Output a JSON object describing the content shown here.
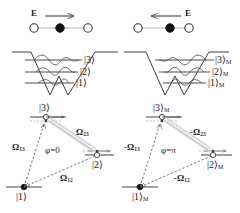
{
  "figure": {
    "colors": {
      "line": "#1a1a1a",
      "wavefunction": "#555555",
      "dashed_level": "#777777",
      "coupling": "#666666",
      "highlight": "#cccccc",
      "atom_filled": "#111111",
      "atom_open": "#ffffff"
    }
  },
  "panels": {
    "top_left": {
      "field_label": "E",
      "field_direction": "right",
      "atoms": [
        {
          "type": "open",
          "name": "atom-open-left"
        },
        {
          "type": "filled",
          "name": "atom-filled-center"
        },
        {
          "type": "open",
          "name": "atom-open-right"
        }
      ]
    },
    "top_right": {
      "field_label": "E",
      "field_direction": "left",
      "atoms": [
        {
          "type": "open",
          "name": "atom-open-left"
        },
        {
          "type": "filled",
          "name": "atom-filled-center"
        },
        {
          "type": "open",
          "name": "atom-open-right"
        }
      ]
    },
    "well_left": {
      "levels": [
        {
          "label": "|3⟩",
          "sub": ""
        },
        {
          "label": "|2⟩",
          "sub": ""
        },
        {
          "label": "|1⟩",
          "sub": ""
        }
      ]
    },
    "well_right": {
      "levels": [
        {
          "label": "|3⟩",
          "sub": "M"
        },
        {
          "label": "|2⟩",
          "sub": "M"
        },
        {
          "label": "|1⟩",
          "sub": "M"
        }
      ]
    },
    "lambda_left": {
      "state_3": {
        "label": "|3⟩",
        "sub": "",
        "population": "empty"
      },
      "state_2": {
        "label": "|2⟩",
        "sub": "",
        "population": "empty"
      },
      "state_1": {
        "label": "|1⟩",
        "sub": "",
        "population": "filled"
      },
      "coupling_13": "Ω",
      "coupling_13_sub": "13",
      "coupling_23": "Ω",
      "coupling_23_sub": "23",
      "coupling_12": "Ω",
      "coupling_12_sub": "12",
      "phase": "φ=0"
    },
    "lambda_right": {
      "state_3": {
        "label": "|3⟩",
        "sub": "M",
        "population": "empty"
      },
      "state_2": {
        "label": "|2⟩",
        "sub": "M",
        "population": "empty"
      },
      "state_1": {
        "label": "|1⟩",
        "sub": "M",
        "population": "filled"
      },
      "coupling_13": "-Ω",
      "coupling_13_sub": "13",
      "coupling_23": "-Ω",
      "coupling_23_sub": "23",
      "coupling_12": "-Ω",
      "coupling_12_sub": "12",
      "phase": "φ=π"
    }
  }
}
